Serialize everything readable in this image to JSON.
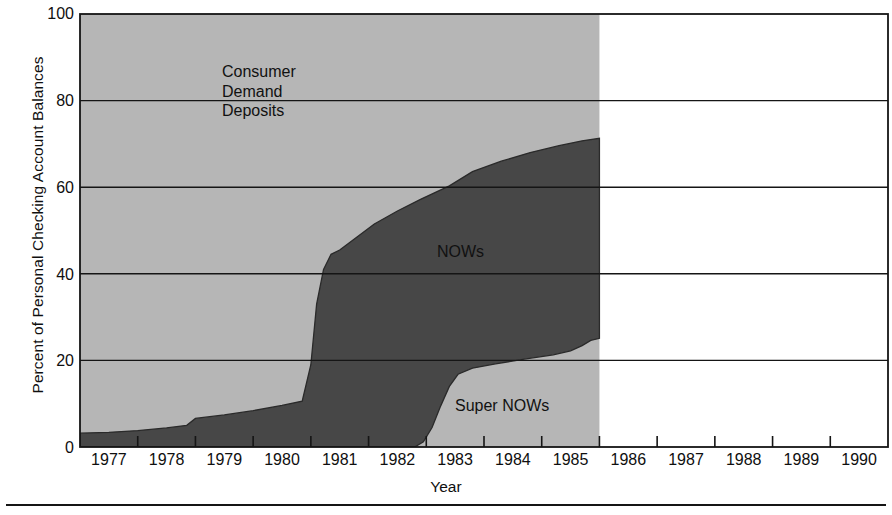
{
  "chart_data": {
    "type": "area",
    "title": "",
    "subtitle": "",
    "xlabel": "Year",
    "ylabel": "Percent of Personal Checking Account Balances",
    "xlim": [
      1976.5,
      1990.5
    ],
    "ylim": [
      0,
      100
    ],
    "stacked": true,
    "stack_total": 100,
    "grid": "horizontal",
    "legend_position": "inline-annotations",
    "x_tick_labels": [
      "1977",
      "1978",
      "1979",
      "1980",
      "1981",
      "1982",
      "1983",
      "1984",
      "1985",
      "1986",
      "1987",
      "1988",
      "1989",
      "1990"
    ],
    "x_tick_values": [
      1977,
      1978,
      1979,
      1980,
      1981,
      1982,
      1983,
      1984,
      1985,
      1986,
      1987,
      1988,
      1989,
      1990
    ],
    "x_tick_mark_values": [
      1977.5,
      1978.5,
      1979.5,
      1980.5,
      1981.5,
      1982.5,
      1983.5,
      1984.5,
      1985.5,
      1986.5,
      1987.5,
      1988.5,
      1989.5
    ],
    "y_tick_labels": [
      "0",
      "20",
      "40",
      "60",
      "80",
      "100"
    ],
    "y_tick_values": [
      0,
      20,
      40,
      60,
      80,
      100
    ],
    "gridline_values": [
      20,
      40,
      60,
      80
    ],
    "data_end_x": 1985.5,
    "annotations": [
      {
        "name": "consumer-demand-deposits",
        "text": "Consumer\nDemand\nDeposits",
        "x": 1979.3,
        "y": 83
      },
      {
        "name": "nows",
        "text": "NOWs",
        "x": 1983.0,
        "y": 47
      },
      {
        "name": "super-nows",
        "text": "Super NOWs",
        "x": 1983.3,
        "y": 12
      }
    ],
    "series": [
      {
        "name": "Super NOWs",
        "color": "#b6b6b6",
        "x": [
          1976.5,
          1982.3,
          1982.45,
          1982.6,
          1982.75,
          1982.9,
          1983.05,
          1983.3,
          1983.7,
          1984.2,
          1984.7,
          1985.0,
          1985.2,
          1985.35,
          1985.5
        ],
        "values": [
          0,
          0,
          1.2,
          4.5,
          9.5,
          14.0,
          16.8,
          18.2,
          19.2,
          20.3,
          21.3,
          22.2,
          23.4,
          24.6,
          25.1
        ]
      },
      {
        "name": "NOWs",
        "color": "#474747",
        "x": [
          1976.5,
          1977.0,
          1977.5,
          1978.0,
          1978.35,
          1978.5,
          1979.0,
          1979.5,
          1980.0,
          1980.35,
          1980.5,
          1980.6,
          1980.72,
          1980.85,
          1981.0,
          1981.3,
          1981.6,
          1982.0,
          1982.4,
          1982.9,
          1983.3,
          1983.8,
          1984.3,
          1984.8,
          1985.2,
          1985.5
        ],
        "values": [
          3.2,
          3.4,
          3.8,
          4.4,
          5.0,
          6.6,
          7.4,
          8.4,
          9.6,
          10.6,
          19.0,
          33.0,
          41.0,
          44.5,
          45.5,
          48.5,
          51.5,
          54.5,
          57.2,
          60.3,
          63.6,
          66.0,
          68.0,
          69.6,
          70.7,
          71.3
        ]
      },
      {
        "name": "Consumer Demand Deposits",
        "color": "#b6b6b6",
        "note": "remainder up to 100 percent",
        "x": [
          1976.5,
          1985.5
        ],
        "values": [
          100,
          100
        ]
      }
    ]
  },
  "axes": {
    "y_label": "Percent of Personal Checking Account Balances",
    "x_label": "Year",
    "y_ticks": [
      "100",
      "80",
      "60",
      "40",
      "20",
      "0"
    ],
    "x_ticks": [
      "1977",
      "1978",
      "1979",
      "1980",
      "1981",
      "1982",
      "1983",
      "1984",
      "1985",
      "1986",
      "1987",
      "1988",
      "1989",
      "1990"
    ]
  },
  "annotations": {
    "consumer_demand_deposits_line1": "Consumer",
    "consumer_demand_deposits_line2": "Demand",
    "consumer_demand_deposits_line3": "Deposits",
    "nows": "NOWs",
    "super_nows": "Super NOWs"
  },
  "colors": {
    "light_band": "#b6b6b6",
    "dark_band": "#474747",
    "axis": "#151515",
    "text": "#0f0f0f",
    "background": "#ffffff"
  }
}
